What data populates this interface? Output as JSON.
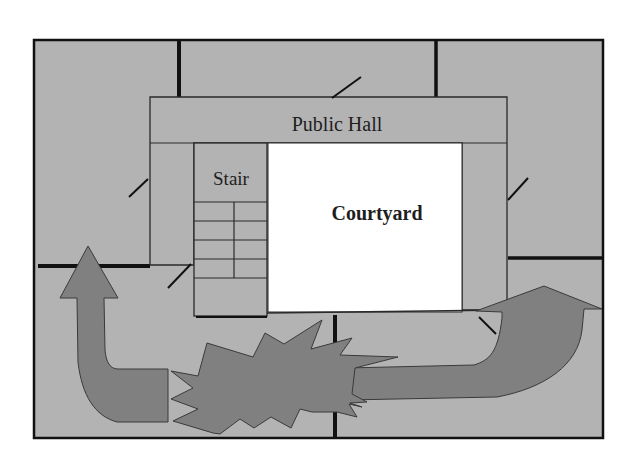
{
  "diagram": {
    "type": "floor-plan",
    "rooms": [
      {
        "id": "public-hall",
        "label": "Public Hall"
      },
      {
        "id": "stair",
        "label": "Stair"
      },
      {
        "id": "courtyard",
        "label": "Courtyard"
      }
    ],
    "markers": [
      {
        "id": "explosion",
        "shape": "starburst"
      },
      {
        "id": "escape-arrow-left",
        "shape": "curved-arrow",
        "direction": "up"
      },
      {
        "id": "escape-arrow-right",
        "shape": "curved-arrow",
        "direction": "up-right"
      }
    ],
    "colors": {
      "floor": "#b3b3b3",
      "courtyard": "#ffffff",
      "marker": "#808080",
      "wall": "#111111",
      "text": "#1e1e1e"
    }
  }
}
